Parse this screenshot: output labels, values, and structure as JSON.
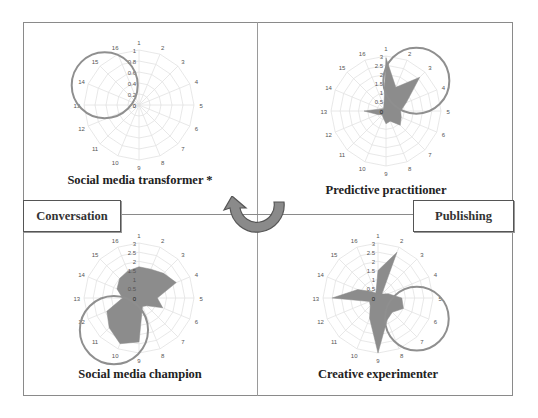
{
  "diagram": {
    "labels": {
      "left": "Conversation",
      "right": "Publishing"
    },
    "center_arrow": "counterclockwise-curved-arrow",
    "colors": {
      "fill": "#8c8c8c",
      "grid": "#e2e2e2",
      "highlight_ring": "#8f8f8f",
      "arrow_fill": "#8a8a8a",
      "arrow_stroke": "#555555"
    }
  },
  "chart_data": [
    {
      "type": "radar",
      "title": "Social media transformer *",
      "categories": [
        "1",
        "2",
        "3",
        "4",
        "5",
        "6",
        "7",
        "8",
        "9",
        "10",
        "11",
        "12",
        "13",
        "14",
        "15",
        "16"
      ],
      "values": [
        0,
        0,
        0,
        0,
        0,
        0,
        0,
        0,
        0,
        0,
        0,
        0,
        0,
        0,
        0,
        0
      ],
      "rticks": [
        "0",
        "0.2",
        "0.4",
        "0.6",
        "0.8",
        "1"
      ],
      "rmax": 1,
      "highlight": "axes 14-16"
    },
    {
      "type": "radar",
      "title": "Predictive practitioner",
      "categories": [
        "1",
        "2",
        "3",
        "4",
        "5",
        "6",
        "7",
        "8",
        "9",
        "10",
        "11",
        "12",
        "13",
        "14",
        "15",
        "16"
      ],
      "values": [
        2.9,
        1.4,
        2.6,
        1.2,
        0.8,
        0.9,
        1.1,
        0.6,
        0.7,
        0.4,
        0.3,
        0.5,
        1.2,
        0.3,
        0.2,
        0.3
      ],
      "rticks": [
        "0",
        "0.5",
        "1",
        "1.5",
        "2",
        "2.5",
        "3"
      ],
      "rmax": 3,
      "highlight": "axes 1-4"
    },
    {
      "type": "radar",
      "title": "Social media champion",
      "categories": [
        "1",
        "2",
        "3",
        "4",
        "5",
        "6",
        "7",
        "8",
        "9",
        "10",
        "11",
        "12",
        "13",
        "14",
        "15",
        "16"
      ],
      "values": [
        1.7,
        1.7,
        1.9,
        2.2,
        1.0,
        1.4,
        0.6,
        0.5,
        2.4,
        2.7,
        2.3,
        1.9,
        0.9,
        1.3,
        1.5,
        1.6
      ],
      "rticks": [
        "0",
        "0.5",
        "1",
        "1.5",
        "2",
        "2.5",
        "3"
      ],
      "rmax": 3,
      "highlight": "axes 10-12"
    },
    {
      "type": "radar",
      "title": "Creative experimenter",
      "categories": [
        "1",
        "2",
        "3",
        "4",
        "5",
        "6",
        "7",
        "8",
        "9",
        "10",
        "11",
        "12",
        "13",
        "14",
        "15",
        "16"
      ],
      "values": [
        1.5,
        2.7,
        0.3,
        0.6,
        1.3,
        1.5,
        1.1,
        1.3,
        3.0,
        1.2,
        0.6,
        0.5,
        2.5,
        1.2,
        0.5,
        0.3
      ],
      "rticks": [
        "0",
        "0.5",
        "1",
        "1.5",
        "2",
        "2.5",
        "3"
      ],
      "rmax": 3,
      "highlight": "axes 5-7"
    }
  ]
}
